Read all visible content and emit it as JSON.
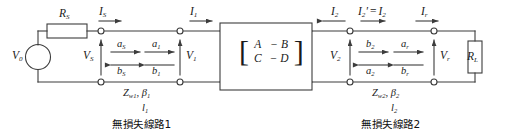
{
  "diagram": {
    "stroke": "#3c3c3c",
    "text_color": "#1a1a1a",
    "background": "#ffffff"
  },
  "source": {
    "voltage_label": "V",
    "voltage_sub": "0",
    "resistor_label": "R",
    "resistor_sub": "S"
  },
  "currents": {
    "i_s": {
      "sym": "I",
      "sub": "S"
    },
    "i_1": {
      "sym": "I",
      "sub": "1"
    },
    "i_2": {
      "sym": "I",
      "sub": "2"
    },
    "i_2_prime": {
      "text": "I₂′ = I₂",
      "sym": "I",
      "sub": "2",
      "prime": "′",
      "eq": "=",
      "sym2": "I",
      "sub2": "2"
    },
    "i_r": {
      "sym": "I",
      "sub": "r"
    }
  },
  "voltages": {
    "v_s": {
      "sym": "V",
      "sub": "S"
    },
    "v_1": {
      "sym": "V",
      "sub": "1"
    },
    "v_2": {
      "sym": "V",
      "sub": "2"
    },
    "v_r": {
      "sym": "V",
      "sub": "r"
    }
  },
  "waves": {
    "pair_s": {
      "forward": {
        "sym": "a",
        "sub": "S"
      },
      "backward": {
        "sym": "b",
        "sub": "S"
      }
    },
    "pair_1": {
      "forward": {
        "sym": "a",
        "sub": "1"
      },
      "backward": {
        "sym": "b",
        "sub": "1"
      }
    },
    "pair_2": {
      "forward": {
        "sym": "b",
        "sub": "2"
      },
      "backward": {
        "sym": "a",
        "sub": "2"
      }
    },
    "pair_r": {
      "forward": {
        "sym": "a",
        "sub": "r"
      },
      "backward": {
        "sym": "b",
        "sub": "r"
      }
    }
  },
  "two_port": {
    "matrix": [
      [
        "A",
        "− B"
      ],
      [
        "C",
        "− D"
      ]
    ],
    "left_bracket": "[",
    "right_bracket": "]"
  },
  "line1": {
    "impedance": {
      "sym": "Z",
      "sub": "w1"
    },
    "beta": {
      "sym": "β",
      "sub": "1"
    },
    "separator": ",",
    "length": {
      "sym": "l",
      "sub": "1"
    },
    "caption": "無損失線路1"
  },
  "line2": {
    "impedance": {
      "sym": "Z",
      "sub": "w2"
    },
    "beta": {
      "sym": "β",
      "sub": "2"
    },
    "separator": ",",
    "length": {
      "sym": "l",
      "sub": "2"
    },
    "caption": "無損失線路2"
  },
  "load": {
    "label": "R",
    "sub": "L"
  }
}
